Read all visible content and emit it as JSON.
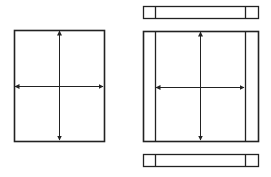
{
  "diagram": {
    "type": "layout-expansion-comparison",
    "stroke_color": "#222222",
    "background": "#ffffff",
    "left_panel": {
      "description": "single rectangle with bidirectional horizontal and vertical arrows",
      "rect": {
        "x": 14,
        "y": 30,
        "w": 90,
        "h": 111
      },
      "v_arrow": {
        "x": 59,
        "y1": 31,
        "y2": 140
      },
      "h_arrow": {
        "y": 86,
        "x1": 15,
        "x2": 103
      }
    },
    "right_panel": {
      "description": "rectangle with fixed side columns, top and bottom bars with fixed end cells, bidirectional arrows in center",
      "top_bar": {
        "x": 143,
        "y": 6,
        "w": 115,
        "h": 12,
        "dividers": [
          155,
          245
        ]
      },
      "main_rect": {
        "x": 143,
        "y": 31,
        "w": 115,
        "h": 110,
        "dividers": [
          155,
          245
        ]
      },
      "bottom_bar": {
        "x": 143,
        "y": 154,
        "w": 115,
        "h": 12,
        "dividers": [
          155,
          245
        ]
      },
      "v_arrow": {
        "x": 200,
        "y1": 32,
        "y2": 140
      },
      "h_arrow": {
        "y": 87,
        "x1": 156,
        "x2": 244
      }
    }
  }
}
